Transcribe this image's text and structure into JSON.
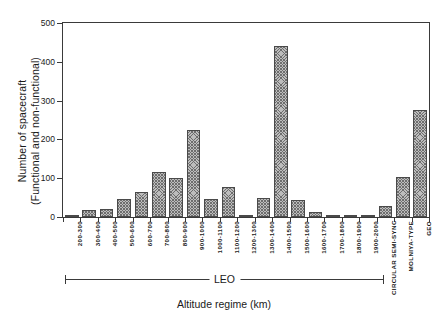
{
  "chart_data": {
    "type": "bar",
    "title": "",
    "xlabel": "Altitude regime (km)",
    "ylabel": "Number of spacecraft\n(Functional and non-functional)",
    "ylim": [
      0,
      500
    ],
    "yticks": [
      0,
      100,
      200,
      300,
      400,
      500
    ],
    "ytick_labels": [
      "0",
      "100",
      "200",
      "300",
      "400",
      "500"
    ],
    "grid": false,
    "legend": null,
    "categories": [
      "200-300",
      "300-400",
      "400-500",
      "500-600",
      "600-700",
      "700-800",
      "800-900",
      "900-1000",
      "1000-1100",
      "1100-1200",
      "1200-1300",
      "1300-1400",
      "1400-1500",
      "1500-1600",
      "1600-1700",
      "1700-1800",
      "1800-1900",
      "1900-2000",
      "CIRCULAR SEMI-SYNC",
      "MOLNIYA-TYPE",
      "GEO"
    ],
    "values": [
      5,
      17,
      20,
      47,
      65,
      115,
      100,
      225,
      46,
      77,
      5,
      48,
      440,
      44,
      13,
      3,
      2,
      2,
      28,
      103,
      275
    ],
    "annotations": [
      {
        "text": "LEO",
        "type": "bracket",
        "spans_categories": [
          "200-300",
          "1900-2000"
        ]
      }
    ],
    "bar_style": {
      "fill": "#bdbdbd",
      "hatch": "crosshatch",
      "hatch_color": "#6e6e6e",
      "edge_color": "#4a4a4a"
    },
    "axis_color": "#3a3a3a"
  },
  "axes": {
    "y_title": "Number of spacecraft\n(Functional and non-functional)",
    "x_title": "Altitude regime (km)",
    "y_ticks": [
      "0",
      "100",
      "200",
      "300",
      "400",
      "500"
    ],
    "x_ticks": [
      "200-300",
      "300-400",
      "400-500",
      "500-600",
      "600-700",
      "700-800",
      "800-900",
      "900-1000",
      "1000-1100",
      "1100-1200",
      "1200-1300",
      "1300-1400",
      "1400-1500",
      "1500-1600",
      "1600-1700",
      "1700-1800",
      "1800-1900",
      "1900-2000"
    ],
    "group_ticks": [
      "CIRCULAR SEMI-SYNC",
      "MOLNIYA-TYPE",
      "GEO"
    ],
    "bracket_label": "LEO"
  }
}
